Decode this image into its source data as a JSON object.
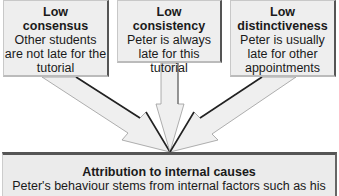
{
  "boxes": [
    {
      "title": "Low",
      "subtitle": "consensus",
      "desc": "Other students are not late for the tutorial"
    },
    {
      "title": "Low",
      "subtitle": "consistency",
      "desc": "Peter is always late for this tutorial"
    },
    {
      "title": "Low",
      "subtitle": "distinctiveness",
      "desc": "Peter is usually late for other appointments"
    }
  ],
  "result": {
    "title": "Attribution to internal causes",
    "desc": "Peter's behaviour stems from internal factors such as his"
  },
  "colors": {
    "box_fill": "#eeeeee",
    "arrow_fill": "#eeeeee",
    "arrow_shadow": "#333333"
  }
}
